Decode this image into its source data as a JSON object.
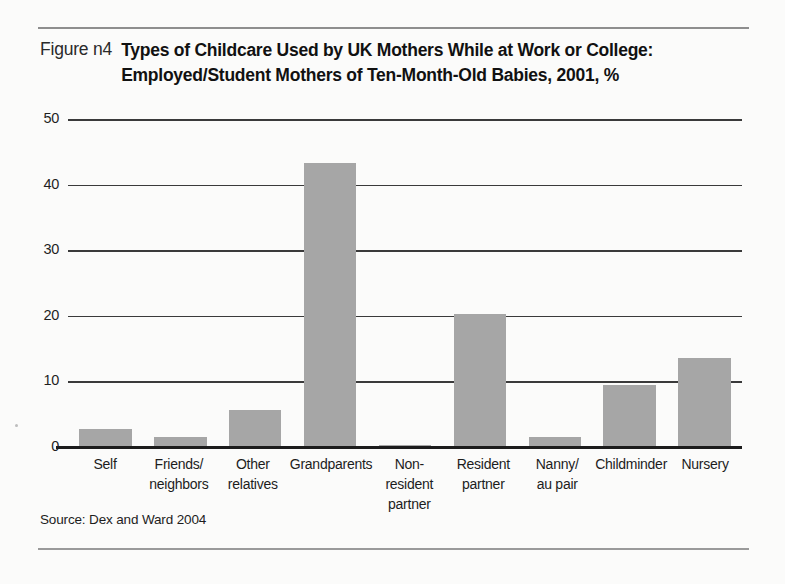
{
  "figure": {
    "label": "Figure n4",
    "title_line1": "Types of Childcare Used by UK Mothers While at Work or College:",
    "title_line2": "Employed/Student Mothers of Ten-Month-Old Babies, 2001, %",
    "source": "Source: Dex and Ward 2004"
  },
  "chart_data": {
    "type": "bar",
    "title": "Types of Childcare Used by UK Mothers While at Work or College: Employed/Student Mothers of Ten-Month-Old Babies, 2001, %",
    "xlabel": "",
    "ylabel": "",
    "ylim": [
      0,
      50
    ],
    "yticks": [
      0,
      10,
      20,
      30,
      40,
      50
    ],
    "ytick_labels": [
      "0",
      "10",
      "20",
      "30",
      "40",
      "50"
    ],
    "grid": true,
    "legend": false,
    "bar_color": "#a6a6a6",
    "categories": [
      "Self",
      "Friends/ neighbors",
      "Other relatives",
      "Grandparents",
      "Non-resident partner",
      "Resident partner",
      "Nanny/ au pair",
      "Childminder",
      "Nursery"
    ],
    "category_lines": [
      [
        "Self",
        ""
      ],
      [
        "Friends/",
        "neighbors"
      ],
      [
        "Other",
        "relatives"
      ],
      [
        "Grandparents",
        ""
      ],
      [
        "Non-resident",
        "partner"
      ],
      [
        "Resident",
        "partner"
      ],
      [
        "Nanny/",
        "au pair"
      ],
      [
        "Childminder",
        ""
      ],
      [
        "Nursery",
        ""
      ]
    ],
    "values": [
      2.8,
      1.6,
      5.6,
      43.3,
      0.3,
      20.3,
      1.5,
      9.4,
      13.6
    ]
  }
}
